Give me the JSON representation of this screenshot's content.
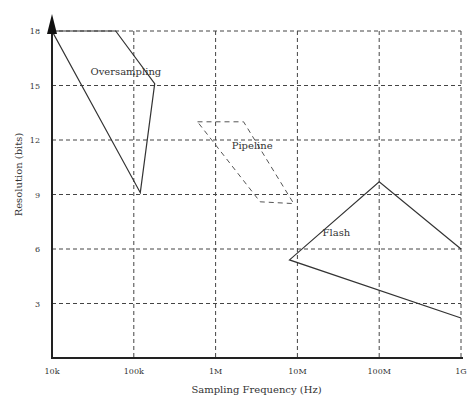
{
  "chart_data": {
    "type": "line",
    "title": "",
    "xlabel": "Sampling Frequency (Hz)",
    "ylabel": "Resolution (bits)",
    "xscale": "log10",
    "xlim": [
      10000,
      1000000000
    ],
    "ylim": [
      0,
      18
    ],
    "grid": true,
    "x_ticks": [
      {
        "value": 10000,
        "label": "10k"
      },
      {
        "value": 100000,
        "label": "100k"
      },
      {
        "value": 1000000,
        "label": "1M"
      },
      {
        "value": 10000000,
        "label": "10M"
      },
      {
        "value": 100000000,
        "label": "100M"
      },
      {
        "value": 1000000000,
        "label": "1G"
      }
    ],
    "y_ticks": [
      {
        "value": 3,
        "label": "3"
      },
      {
        "value": 6,
        "label": "6"
      },
      {
        "value": 9,
        "label": "9"
      },
      {
        "value": 12,
        "label": "12"
      },
      {
        "value": 15,
        "label": "15"
      },
      {
        "value": 18,
        "label": "18"
      }
    ],
    "series": [
      {
        "name": "Oversampling",
        "style": "solid",
        "closed": true,
        "points": [
          [
            10000,
            18
          ],
          [
            60000,
            18
          ],
          [
            180000,
            15.1
          ],
          [
            120000,
            9.1
          ]
        ],
        "label_at": [
          80000,
          15.6
        ]
      },
      {
        "name": "Pipeline",
        "style": "dashed",
        "closed": true,
        "points": [
          [
            600000,
            13.0
          ],
          [
            2200000,
            13.0
          ],
          [
            9000000,
            8.5
          ],
          [
            3500000,
            8.6
          ]
        ],
        "label_at": [
          2800000,
          11.5
        ]
      },
      {
        "name": "Flash",
        "style": "solid",
        "closed": false,
        "points": [
          [
            1000000000,
            6.0
          ],
          [
            100000000,
            9.7
          ],
          [
            8000000,
            5.4
          ],
          [
            1000000000,
            2.2
          ]
        ],
        "label_at": [
          30000000,
          6.7
        ]
      }
    ]
  }
}
